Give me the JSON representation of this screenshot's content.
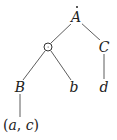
{
  "diagram": {
    "type": "tree",
    "nodes": [
      {
        "id": "A",
        "label": "A",
        "accent": "dot-above",
        "x": 76,
        "y": 16
      },
      {
        "id": "odot",
        "label": "⊙",
        "symbol": "circled-dot-operator",
        "x": 48,
        "y": 47
      },
      {
        "id": "C",
        "label": "C",
        "x": 104,
        "y": 47
      },
      {
        "id": "B",
        "label": "B",
        "x": 20,
        "y": 87
      },
      {
        "id": "b",
        "label": "b",
        "x": 74,
        "y": 87
      },
      {
        "id": "d",
        "label": "d",
        "x": 104,
        "y": 87
      },
      {
        "id": "ac",
        "label": "(a, c)",
        "x": 21,
        "y": 125
      }
    ],
    "edges": [
      {
        "from": "A",
        "to": "odot"
      },
      {
        "from": "A",
        "to": "C"
      },
      {
        "from": "odot",
        "to": "B"
      },
      {
        "from": "odot",
        "to": "b"
      },
      {
        "from": "C",
        "to": "d"
      },
      {
        "from": "B",
        "to": "ac"
      }
    ],
    "colors": {
      "line": "#333333",
      "text": "#222222",
      "background": "#ffffff"
    }
  },
  "labels": {
    "A": "A",
    "C": "C",
    "B": "B",
    "b": "b",
    "d": "d",
    "ac_open": "(",
    "ac_a": "a",
    "ac_comma": ", ",
    "ac_c": "c",
    "ac_close": ")"
  }
}
